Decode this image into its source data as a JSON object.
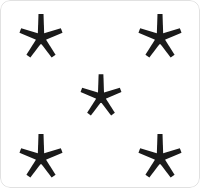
{
  "canvas": {
    "width": 200,
    "height": 188,
    "background_color": "#ffffff",
    "border_radius": 10,
    "border_color": "#b4b4b4",
    "description": "white rounded card with five black asterisk stars"
  },
  "shape": {
    "name": "five-pointed-asterisk-star",
    "icon_name": "star-asterisk-icon",
    "fill_color": "#1a1a1a",
    "ray_count": 5,
    "width": 42,
    "height": 47,
    "ray_angles_deg": [
      90,
      18,
      342,
      234,
      306
    ]
  },
  "stars": [
    {
      "id": "star-top-left",
      "label": "top-left star",
      "cx": 41,
      "cy": 38,
      "scale": 1.0
    },
    {
      "id": "star-top-right",
      "label": "top-right star",
      "cx": 160,
      "cy": 38,
      "scale": 1.0
    },
    {
      "id": "star-center",
      "label": "center star",
      "cx": 101,
      "cy": 97,
      "scale": 0.95
    },
    {
      "id": "star-bottom-left",
      "label": "bottom-left star",
      "cx": 41,
      "cy": 158,
      "scale": 1.0
    },
    {
      "id": "star-bottom-right",
      "label": "bottom-right star",
      "cx": 160,
      "cy": 158,
      "scale": 1.0
    }
  ],
  "counts": {
    "star_count": 5,
    "arrangement": "quincunx"
  }
}
